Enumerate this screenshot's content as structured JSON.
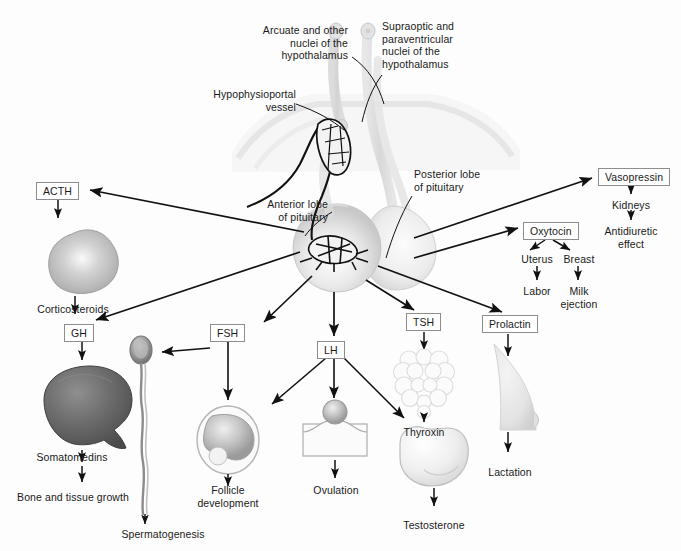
{
  "figure": {
    "background_color": "#fdfdfd",
    "text_color": "#1a1a1a",
    "box_border_color": "#8d8d8d"
  },
  "anatomy_labels": [
    {
      "id": "arcuate",
      "text": "Arcuate and other\nnuclei of the\nhypothalamus",
      "align": "right",
      "x": 228,
      "y": 24,
      "w": 120
    },
    {
      "id": "supraoptic",
      "text": "Supraoptic and\nparaventricular\nnuclei of the\nhypothalamus",
      "align": "left",
      "x": 382,
      "y": 20,
      "w": 120
    },
    {
      "id": "hypophysioportal",
      "text": "Hypophysioportal\nvessel",
      "align": "right",
      "x": 186,
      "y": 88,
      "w": 110
    },
    {
      "id": "posterior-lobe",
      "text": "Posterior lobe\nof pituitary",
      "align": "left",
      "x": 414,
      "y": 168,
      "w": 100
    },
    {
      "id": "anterior-lobe",
      "text": "Anterior lobe\nof pituitary",
      "align": "right",
      "x": 228,
      "y": 198,
      "w": 100
    }
  ],
  "hormone_boxes": [
    {
      "id": "acth",
      "label": "ACTH",
      "x": 36,
      "y": 182
    },
    {
      "id": "gh",
      "label": "GH",
      "x": 64,
      "y": 324
    },
    {
      "id": "fsh",
      "label": "FSH",
      "x": 210,
      "y": 324
    },
    {
      "id": "lh",
      "label": "LH",
      "x": 317,
      "y": 341
    },
    {
      "id": "tsh",
      "label": "TSH",
      "x": 406,
      "y": 313
    },
    {
      "id": "prolactin",
      "label": "Prolactin",
      "x": 482,
      "y": 315
    },
    {
      "id": "vasopressin",
      "label": "Vasopressin",
      "x": 598,
      "y": 168
    },
    {
      "id": "oxytocin",
      "label": "Oxytocin",
      "x": 523,
      "y": 222
    }
  ],
  "outcome_labels": [
    {
      "id": "corticosteroids",
      "text": "Corticosteroids",
      "x": 73,
      "y": 303
    },
    {
      "id": "somatomedins",
      "text": "Somatomedins",
      "x": 72,
      "y": 451
    },
    {
      "id": "bone-tissue-growth",
      "text": "Bone and tissue growth",
      "x": 73,
      "y": 491
    },
    {
      "id": "spermatogenesis",
      "text": "Spermatogenesis",
      "x": 163,
      "y": 528
    },
    {
      "id": "follicle-development",
      "text": "Follicle\ndevelopment",
      "x": 228,
      "y": 484
    },
    {
      "id": "ovulation",
      "text": "Ovulation",
      "x": 336,
      "y": 484
    },
    {
      "id": "thyroxin",
      "text": "Thyroxin",
      "x": 422,
      "y": 426
    },
    {
      "id": "testosterone",
      "text": "Testosterone",
      "x": 426,
      "y": 519
    },
    {
      "id": "lactation",
      "text": "Lactation",
      "x": 510,
      "y": 466
    },
    {
      "id": "kidneys",
      "text": "Kidneys",
      "x": 631,
      "y": 199
    },
    {
      "id": "antidiuretic-effect",
      "text": "Antidiuretic\neffect",
      "x": 631,
      "y": 225
    },
    {
      "id": "uterus",
      "text": "Uterus",
      "x": 521,
      "y": 253
    },
    {
      "id": "breast",
      "text": "Breast",
      "x": 563,
      "y": 253
    },
    {
      "id": "labor",
      "text": "Labor",
      "x": 521,
      "y": 285
    },
    {
      "id": "milk-ejection",
      "text": "Milk\nejection",
      "x": 564,
      "y": 285
    }
  ],
  "organs": [
    {
      "id": "adrenal-gland",
      "name": "adrenal-gland-illustration",
      "target": "Corticosteroids"
    },
    {
      "id": "liver",
      "name": "liver-illustration",
      "target": "Somatomedins"
    },
    {
      "id": "sperm",
      "name": "sperm-cell-illustration",
      "target": "Spermatogenesis"
    },
    {
      "id": "follicle",
      "name": "ovarian-follicle-illustration",
      "target": "Follicle development"
    },
    {
      "id": "ovulation-icon",
      "name": "ovulation-illustration",
      "target": "Ovulation"
    },
    {
      "id": "thyroid",
      "name": "thyroid-gland-illustration",
      "target": "Thyroxin"
    },
    {
      "id": "testis",
      "name": "testis-illustration",
      "target": "Testosterone"
    },
    {
      "id": "breast-organ",
      "name": "breast-illustration",
      "target": "Lactation"
    },
    {
      "id": "pituitary",
      "name": "pituitary-gland-illustration",
      "target": "Anterior and posterior lobes"
    }
  ]
}
